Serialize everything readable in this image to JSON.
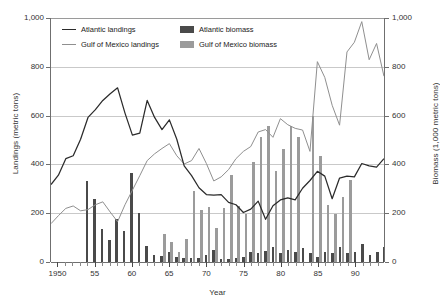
{
  "chart_data": {
    "type": "line",
    "title": "",
    "xlabel": "Year",
    "ylabel": "Landings (metric tons)",
    "ylabel_secondary": "Biomass (1,000 metric tons)",
    "grid": true,
    "legend_position": "top-left-inside",
    "xlim": [
      1949,
      1994
    ],
    "ylim": [
      0,
      1000
    ],
    "ylim_secondary": [
      0,
      1000
    ],
    "yticks": [
      0,
      200,
      400,
      600,
      800,
      1000
    ],
    "ytick_labels": [
      "0",
      "200",
      "400",
      "600",
      "800",
      "1,000"
    ],
    "ytick_labels_secondary": [
      "0",
      "200",
      "400",
      "600",
      "800",
      "1,000"
    ],
    "xticks": [
      1950,
      1955,
      1960,
      1965,
      1970,
      1975,
      1980,
      1985,
      1990
    ],
    "xtick_labels": [
      "1950",
      "55",
      "60",
      "65",
      "70",
      "75",
      "80",
      "85",
      "90"
    ],
    "years": [
      1949,
      1950,
      1951,
      1952,
      1953,
      1954,
      1955,
      1956,
      1957,
      1958,
      1959,
      1960,
      1961,
      1962,
      1963,
      1964,
      1965,
      1966,
      1967,
      1968,
      1969,
      1970,
      1971,
      1972,
      1973,
      1974,
      1975,
      1976,
      1977,
      1978,
      1979,
      1980,
      1981,
      1982,
      1983,
      1984,
      1985,
      1986,
      1987,
      1988,
      1989,
      1990,
      1991,
      1992,
      1993,
      1994
    ],
    "series": [
      {
        "name": "Atlantic landings",
        "type": "line",
        "axis": "left",
        "color": "#2b2b2b",
        "unit": "metric tons",
        "values": [
          313,
          352,
          420,
          432,
          500,
          590,
          622,
          660,
          688,
          712,
          608,
          517,
          525,
          660,
          590,
          540,
          580,
          500,
          390,
          350,
          300,
          272,
          270,
          272,
          240,
          230,
          198,
          212,
          245,
          170,
          226,
          250,
          258,
          250,
          298,
          330,
          368,
          348,
          255,
          340,
          348,
          345,
          400,
          390,
          385,
          420
        ]
      },
      {
        "name": "Gulf of Mexico landings",
        "type": "line",
        "axis": "left",
        "color": "#8f8f8f",
        "unit": "metric tons",
        "values": [
          152,
          185,
          215,
          225,
          205,
          210,
          230,
          242,
          200,
          160,
          230,
          290,
          350,
          412,
          440,
          462,
          482,
          432,
          398,
          412,
          462,
          400,
          328,
          345,
          375,
          420,
          450,
          470,
          530,
          540,
          508,
          585,
          560,
          545,
          538,
          450,
          820,
          755,
          640,
          558,
          860,
          900,
          985,
          828,
          895,
          760
        ]
      },
      {
        "name": "Atlantic biomass",
        "type": "bar",
        "axis": "right",
        "color": "#4a4a4a",
        "unit": "1,000 metric tons",
        "start_year": 1954,
        "values": [
          330,
          258,
          135,
          90,
          175,
          128,
          365,
          202,
          66,
          30,
          25,
          40,
          22,
          18,
          16,
          18,
          30,
          50,
          14,
          12,
          16,
          20,
          40,
          38,
          44,
          60,
          38,
          48,
          42,
          58,
          38,
          22,
          40,
          36,
          62,
          36,
          40,
          74,
          30,
          42,
          62
        ]
      },
      {
        "name": "Gulf of Mexico biomass",
        "type": "bar",
        "axis": "right",
        "color": "#9b9b9b",
        "unit": "1,000 metric tons",
        "start_year": 1964,
        "values": [
          115,
          82,
          40,
          95,
          292,
          214,
          224,
          140,
          220,
          355,
          228,
          195,
          410,
          512,
          556,
          375,
          462,
          558,
          512,
          0,
          598,
          435,
          235,
          195,
          265,
          335,
          0,
          0,
          0
        ]
      }
    ]
  },
  "legend": {
    "items": [
      {
        "label": "Atlantic landings",
        "marker": "line",
        "color": "#2b2b2b"
      },
      {
        "label": "Gulf of Mexico landings",
        "marker": "line",
        "color": "#8f8f8f"
      },
      {
        "label": "Atlantic biomass",
        "marker": "box",
        "color": "#4a4a4a"
      },
      {
        "label": "Gulf of Mexico biomass",
        "marker": "box",
        "color": "#9b9b9b"
      }
    ]
  }
}
